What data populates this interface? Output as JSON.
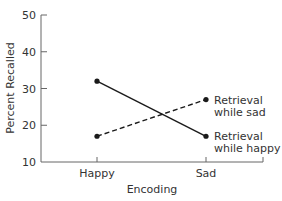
{
  "chart_data": {
    "type": "line",
    "title": "",
    "xlabel": "Encoding",
    "ylabel": "Percent Recalled",
    "categories": [
      "Happy",
      "Sad"
    ],
    "ylim": [
      10,
      50
    ],
    "yticks": [
      10,
      20,
      30,
      40,
      50
    ],
    "grid": false,
    "legend_position": "inline-right",
    "series": [
      {
        "name": "Retrieval while happy",
        "label_lines": [
          "Retrieval",
          "while happy"
        ],
        "style": "solid",
        "values": [
          32,
          17
        ]
      },
      {
        "name": "Retrieval while sad",
        "label_lines": [
          "Retrieval",
          "while sad"
        ],
        "style": "dashed",
        "values": [
          17,
          27
        ]
      }
    ]
  },
  "colors": {
    "axis": "#666666",
    "line": "#1a1a1a",
    "text": "#333333"
  }
}
